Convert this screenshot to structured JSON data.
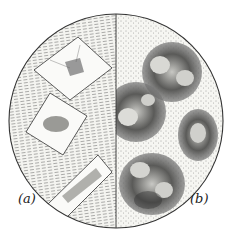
{
  "figure": {
    "type": "microscope field illustration",
    "panels": [
      {
        "label": "(a)",
        "description": "rhombic crystals in striated ground"
      },
      {
        "label": "(b)",
        "description": "dark granular spherical bodies in stippled ground"
      }
    ]
  }
}
